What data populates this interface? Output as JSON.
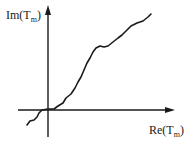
{
  "diagram": {
    "y_axis_label": {
      "main": "Im(T",
      "sub": "m",
      "close": ")"
    },
    "x_axis_label": {
      "main": "Re(T",
      "sub": "m",
      "close": ")"
    },
    "colors": {
      "stroke": "#1a1a1a",
      "background": "#ffffff"
    },
    "axes": {
      "origin": [
        48,
        110
      ],
      "y_axis": {
        "from": [
          48,
          137
        ],
        "to": [
          48,
          5
        ]
      },
      "x_axis": {
        "from": [
          18,
          110
        ],
        "to": [
          175,
          110
        ]
      }
    },
    "curve_points": [
      [
        27,
        125
      ],
      [
        30,
        121
      ],
      [
        34,
        120
      ],
      [
        37,
        117
      ],
      [
        39,
        113
      ],
      [
        42,
        110
      ],
      [
        48,
        109
      ],
      [
        54,
        109
      ],
      [
        58,
        106
      ],
      [
        63,
        103
      ],
      [
        66,
        98
      ],
      [
        71,
        94
      ],
      [
        75,
        88
      ],
      [
        78,
        82
      ],
      [
        81,
        77
      ],
      [
        84,
        70
      ],
      [
        87,
        63
      ],
      [
        90,
        58
      ],
      [
        93,
        52
      ],
      [
        96,
        48
      ],
      [
        100,
        46
      ],
      [
        104,
        47
      ],
      [
        108,
        46
      ],
      [
        113,
        42
      ],
      [
        118,
        38
      ],
      [
        122,
        35
      ],
      [
        126,
        31
      ],
      [
        131,
        26
      ],
      [
        137,
        23
      ],
      [
        143,
        21
      ],
      [
        148,
        17
      ],
      [
        151,
        14
      ]
    ]
  }
}
